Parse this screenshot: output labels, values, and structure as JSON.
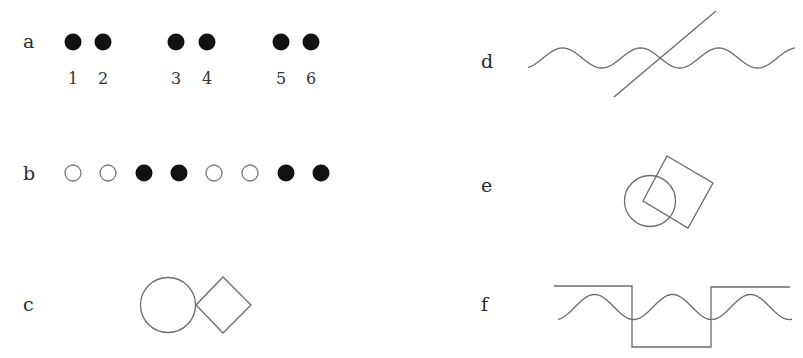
{
  "panels": {
    "a": {
      "label": "a",
      "dots": [
        {
          "x": 73,
          "number": "1",
          "filled": true
        },
        {
          "x": 103,
          "number": "2",
          "filled": true
        },
        {
          "x": 176,
          "number": "3",
          "filled": true
        },
        {
          "x": 207,
          "number": "4",
          "filled": true
        },
        {
          "x": 281,
          "number": "5",
          "filled": true
        },
        {
          "x": 311,
          "number": "6",
          "filled": true
        }
      ]
    },
    "b": {
      "label": "b",
      "dots": [
        {
          "x": 73,
          "filled": false
        },
        {
          "x": 108,
          "filled": false
        },
        {
          "x": 144,
          "filled": true
        },
        {
          "x": 179,
          "filled": true
        },
        {
          "x": 214,
          "filled": false
        },
        {
          "x": 250,
          "filled": false
        },
        {
          "x": 286,
          "filled": true
        },
        {
          "x": 321,
          "filled": true
        }
      ]
    },
    "c": {
      "label": "c",
      "shapes": [
        "circle",
        "diamond"
      ]
    },
    "d": {
      "label": "d",
      "shapes": [
        "sine-wave",
        "diagonal-line"
      ]
    },
    "e": {
      "label": "e",
      "shapes": [
        "circle",
        "rotated-square"
      ]
    },
    "f": {
      "label": "f",
      "shapes": [
        "square-wave",
        "sine-wave"
      ]
    }
  },
  "colors": {
    "filled_dot": "#111111",
    "line": "#6b6b6b",
    "background": "#ffffff"
  }
}
